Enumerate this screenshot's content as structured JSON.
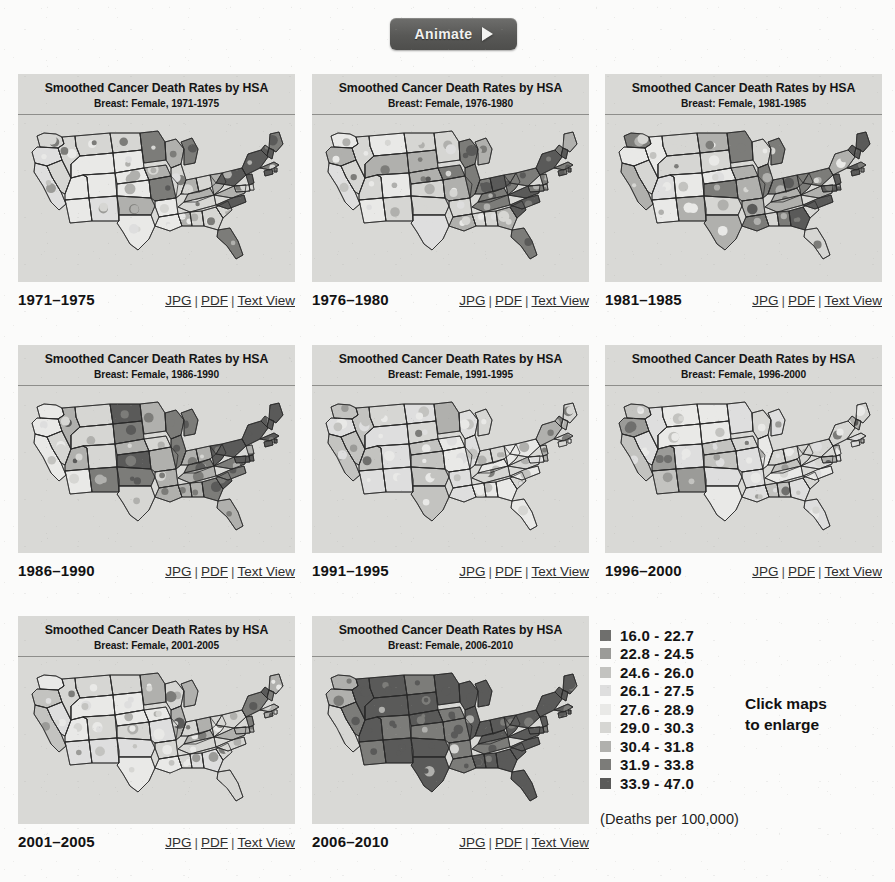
{
  "toolbar": {
    "animate_label": "Animate",
    "play_icon": "play-triangle-icon"
  },
  "panel_title": "Smoothed Cancer Death Rates by HSA",
  "links": {
    "jpg": "JPG",
    "pdf": "PDF",
    "text_view": "Text View",
    "separator": "|"
  },
  "maps": [
    {
      "subtitle": "Breast: Female, 1971-1975",
      "years": "1971–1975",
      "tone": 0.0
    },
    {
      "subtitle": "Breast: Female, 1976-1980",
      "years": "1976–1980",
      "tone": 0.06
    },
    {
      "subtitle": "Breast: Female, 1981-1985",
      "years": "1981–1985",
      "tone": 0.13
    },
    {
      "subtitle": "Breast: Female, 1986-1990",
      "years": "1986–1990",
      "tone": 0.22
    },
    {
      "subtitle": "Breast: Female, 1991-1995",
      "years": "1991–1995",
      "tone": -0.32
    },
    {
      "subtitle": "Breast: Female, 1996-2000",
      "years": "1996–2000",
      "tone": -0.46
    },
    {
      "subtitle": "Breast: Female, 2001-2005",
      "years": "2001–2005",
      "tone": -0.2
    },
    {
      "subtitle": "Breast: Female, 2006-2010",
      "years": "2006–2010",
      "tone": 0.58
    }
  ],
  "legend": {
    "title_units": "(Deaths per 100,000)",
    "entries": [
      {
        "label": "16.0 - 22.7",
        "color": "#6f6f6d"
      },
      {
        "label": "22.8 - 24.5",
        "color": "#9b9b98"
      },
      {
        "label": "24.6 - 26.0",
        "color": "#c3c3c0"
      },
      {
        "label": "26.1 - 27.5",
        "color": "#dedede"
      },
      {
        "label": "27.6 - 28.9",
        "color": "#e9e9e7"
      },
      {
        "label": "29.0 - 30.3",
        "color": "#d6d6d3"
      },
      {
        "label": "30.4 - 31.8",
        "color": "#b0b0ad"
      },
      {
        "label": "31.9 - 33.8",
        "color": "#7c7c79"
      },
      {
        "label": "33.9 - 47.0",
        "color": "#5a5a59"
      }
    ]
  },
  "click_note": "Click maps\nto enlarge",
  "figure_caption": ""
}
